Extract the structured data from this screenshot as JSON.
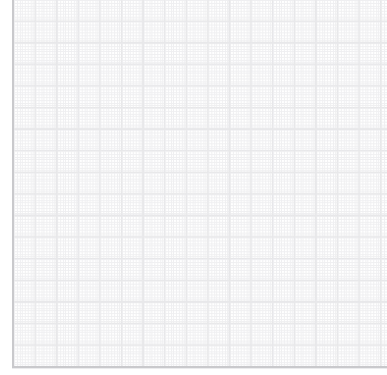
{
  "app": {
    "title": "Blank Grid Canvas",
    "surface_type": "graph-paper-grid",
    "content_text": "",
    "is_empty": true
  },
  "canvas": {
    "name": "drawing-canvas",
    "background_color": "#ffffff",
    "left_offset_px": 14,
    "top_offset_px": 0,
    "width_px": 373,
    "height_px": 366
  },
  "grid": {
    "major_cell_px": 21.6,
    "major_line_color": "#e3e3e5",
    "minor_line_color": "#ededef",
    "accent_line_color": "#e8e8ea",
    "accent_every_n_cells": 4,
    "columns": 17,
    "rows": 17,
    "style": "dotted-over-solid"
  },
  "frame": {
    "left_rule_color": "#c9c9cc",
    "bottom_rule_color": "#c9c9cc",
    "left_rule_x_px": 12,
    "bottom_rule_y_px": 366,
    "rule_thickness_px": 2
  },
  "viewport": {
    "width_px": 387,
    "height_px": 375
  }
}
